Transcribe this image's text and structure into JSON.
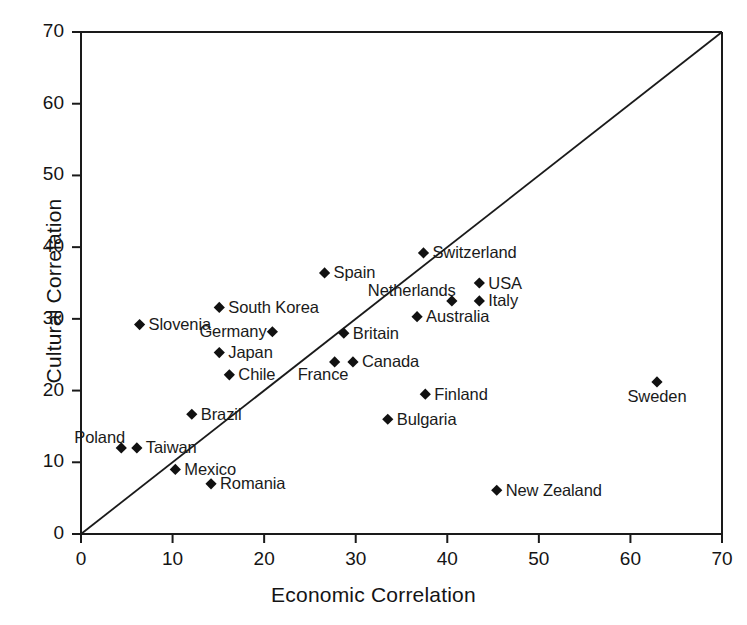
{
  "chart_data": {
    "type": "scatter",
    "title": "",
    "xlabel": "Economic Correlation",
    "ylabel": "Cultural Correlation",
    "xlim": [
      0,
      70
    ],
    "ylim": [
      0,
      70
    ],
    "xticks": [
      0,
      10,
      20,
      30,
      40,
      50,
      60,
      70
    ],
    "yticks": [
      0,
      10,
      20,
      30,
      40,
      50,
      60,
      70
    ],
    "grid": false,
    "legend": "none",
    "reference_line": {
      "name": "identity-line",
      "description": "y = x diagonal",
      "from": [
        0,
        0
      ],
      "to": [
        70,
        70
      ]
    },
    "marker_style": "filled diamond",
    "marker_color": "#111111",
    "points": [
      {
        "label": "Slovenia",
        "x": 6.4,
        "y": 29.2,
        "label_pos": "right"
      },
      {
        "label": "South Korea",
        "x": 15.1,
        "y": 31.6,
        "label_pos": "right"
      },
      {
        "label": "Germany",
        "x": 20.9,
        "y": 28.2,
        "label_pos": "left"
      },
      {
        "label": "Japan",
        "x": 15.1,
        "y": 25.3,
        "label_pos": "right"
      },
      {
        "label": "Chile",
        "x": 16.2,
        "y": 22.2,
        "label_pos": "right"
      },
      {
        "label": "Poland",
        "x": 4.4,
        "y": 12.0,
        "label_pos": "above-left"
      },
      {
        "label": "Taiwan",
        "x": 6.1,
        "y": 12.0,
        "label_pos": "right"
      },
      {
        "label": "Brazil",
        "x": 12.1,
        "y": 16.7,
        "label_pos": "right"
      },
      {
        "label": "Mexico",
        "x": 10.3,
        "y": 9.0,
        "label_pos": "right"
      },
      {
        "label": "Romania",
        "x": 14.2,
        "y": 7.0,
        "label_pos": "right"
      },
      {
        "label": "Spain",
        "x": 26.6,
        "y": 36.4,
        "label_pos": "right"
      },
      {
        "label": "Britain",
        "x": 28.7,
        "y": 28.0,
        "label_pos": "right"
      },
      {
        "label": "France",
        "x": 27.7,
        "y": 24.0,
        "label_pos": "below-left"
      },
      {
        "label": "Canada",
        "x": 29.7,
        "y": 24.0,
        "label_pos": "right"
      },
      {
        "label": "Switzerland",
        "x": 37.4,
        "y": 39.2,
        "label_pos": "right"
      },
      {
        "label": "Netherlands",
        "x": 40.5,
        "y": 32.5,
        "label_pos": "above-left"
      },
      {
        "label": "USA",
        "x": 43.5,
        "y": 35.0,
        "label_pos": "right"
      },
      {
        "label": "Italy",
        "x": 43.5,
        "y": 32.5,
        "label_pos": "right"
      },
      {
        "label": "Australia",
        "x": 36.7,
        "y": 30.3,
        "label_pos": "right"
      },
      {
        "label": "Finland",
        "x": 37.6,
        "y": 19.5,
        "label_pos": "right"
      },
      {
        "label": "Bulgaria",
        "x": 33.5,
        "y": 16.0,
        "label_pos": "right"
      },
      {
        "label": "Sweden",
        "x": 62.9,
        "y": 21.2,
        "label_pos": "below"
      },
      {
        "label": "New Zealand",
        "x": 45.4,
        "y": 6.1,
        "label_pos": "right"
      }
    ]
  },
  "axes": {
    "x_title": "Economic Correlation",
    "y_title": "Cultural Correlation",
    "x_tick_labels": [
      "0",
      "10",
      "20",
      "30",
      "40",
      "50",
      "60",
      "70"
    ],
    "y_tick_labels": [
      "0",
      "10",
      "20",
      "30",
      "40",
      "50",
      "60",
      "70"
    ]
  },
  "colors": {
    "marker": "#111111",
    "axis": "#1a1a1a",
    "background": "#ffffff",
    "text": "#141414"
  }
}
